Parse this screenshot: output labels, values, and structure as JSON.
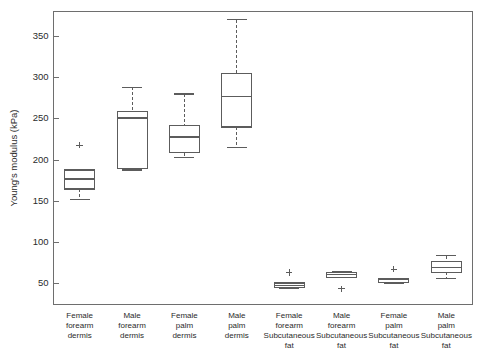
{
  "chart_data": {
    "type": "box",
    "title": "",
    "xlabel": "",
    "ylabel": "Young's modulus (kPa)",
    "ylim": [
      25,
      380
    ],
    "grid": false,
    "legend": null,
    "yticks": [
      50,
      100,
      150,
      200,
      250,
      300,
      350
    ],
    "ytick_labels": [
      "50",
      "100",
      "150",
      "200",
      "250",
      "300",
      "350"
    ],
    "categories": [
      "Female forearm dermis",
      "Male forearm dermis",
      "Female palm dermis",
      "Male palm dermis",
      "Female forearm Subcutaneous fat",
      "Male forearm Subcutaneous fat",
      "Female palm Subcutaneous fat",
      "Male palm Subcutaneous fat"
    ],
    "category_lines": [
      [
        "Female",
        "forearm",
        "dermis"
      ],
      [
        "Male",
        "forearm",
        "dermis"
      ],
      [
        "Female",
        "palm",
        "dermis"
      ],
      [
        "Male",
        "palm",
        "dermis"
      ],
      [
        "Female",
        "forearm",
        "Subcutaneous",
        "fat"
      ],
      [
        "Male",
        "forearm",
        "Subcutaneous",
        "fat"
      ],
      [
        "Female",
        "palm",
        "Subcutaneous",
        "fat"
      ],
      [
        "Male",
        "palm",
        "Subcutaneous",
        "fat"
      ]
    ],
    "boxes": [
      {
        "name": "Female forearm dermis",
        "whisker_low": 152,
        "q1": 165,
        "median": 177,
        "q3": 188,
        "whisker_high": 188,
        "outliers": [
          218
        ]
      },
      {
        "name": "Male forearm dermis",
        "whisker_low": 188,
        "q1": 190,
        "median": 251,
        "q3": 259,
        "whisker_high": 288,
        "outliers": []
      },
      {
        "name": "Female palm dermis",
        "whisker_low": 203,
        "q1": 209,
        "median": 228,
        "q3": 242,
        "whisker_high": 280,
        "outliers": []
      },
      {
        "name": "Male palm dermis",
        "whisker_low": 215,
        "q1": 240,
        "median": 277,
        "q3": 305,
        "whisker_high": 370,
        "outliers": []
      },
      {
        "name": "Female forearm Subcutaneous fat",
        "whisker_low": 45,
        "q1": 46,
        "median": 48,
        "q3": 51,
        "whisker_high": 51,
        "outliers": [
          64
        ]
      },
      {
        "name": "Male forearm Subcutaneous fat",
        "whisker_low": 58,
        "q1": 58,
        "median": 61,
        "q3": 64,
        "whisker_high": 65,
        "outliers": [
          44
        ]
      },
      {
        "name": "Female palm Subcutaneous fat",
        "whisker_low": 51,
        "q1": 52,
        "median": 55,
        "q3": 57,
        "whisker_high": 57,
        "outliers": [
          68
        ]
      },
      {
        "name": "Male palm Subcutaneous fat",
        "whisker_low": 56,
        "q1": 64,
        "median": 70,
        "q3": 77,
        "whisker_high": 84,
        "outliers": []
      }
    ],
    "colors": {
      "frame": "#6e6e6e",
      "box_edge": "#5c5c5c",
      "box_fill": "#ffffff",
      "text": "#2b2b2b",
      "background": "#ffffff"
    }
  }
}
